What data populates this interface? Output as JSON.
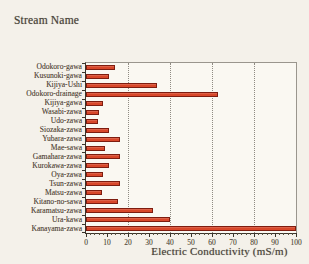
{
  "figure": {
    "title": "Stream Name",
    "xlabel": "Electric Conductivity (mS/m)"
  },
  "colors": {
    "bar_fill": "#d8472a",
    "bar_border": "#7e1d10",
    "gridline": "#8f8b83",
    "axis": "#3a352c",
    "paper_background": "#f4f1ea",
    "plot_background": "#faf8f2",
    "text": "#4a443a"
  },
  "chart_data": {
    "type": "bar",
    "orientation": "horizontal",
    "title": "Stream Name",
    "xlabel": "Electric Conductivity (mS/m)",
    "ylabel": "",
    "xlim": [
      0,
      100
    ],
    "xticks": [
      0,
      10,
      20,
      30,
      40,
      50,
      60,
      70,
      80,
      90,
      100
    ],
    "minor_tick_step": 2,
    "gridlines_x": [
      20,
      40,
      60,
      80
    ],
    "grid_style": "dotted",
    "legend": "none",
    "categories": [
      "Odokoro-gawa",
      "Kusunoki-gawa",
      "Kijiya-Ushi",
      "Odokoro-drainage",
      "Kijiya-gawa",
      "Wasabi-zawa",
      "Udo-zawa",
      "Siozaka-zawa",
      "Yubara-zawa",
      "Mae-sawa",
      "Gamahara-zawa",
      "Kurokawa-zawa",
      "Oya-zawa",
      "Tsun-zawa",
      "Matsu-zawa",
      "Kitano-no-sawa",
      "Karamatsu-zawa",
      "Ura-kawa",
      "Kanayama-zawa"
    ],
    "values": [
      14,
      11,
      34,
      63,
      8,
      6,
      5.5,
      11,
      16,
      9,
      16,
      11,
      8,
      16,
      7.5,
      15,
      32,
      40,
      100
    ]
  }
}
